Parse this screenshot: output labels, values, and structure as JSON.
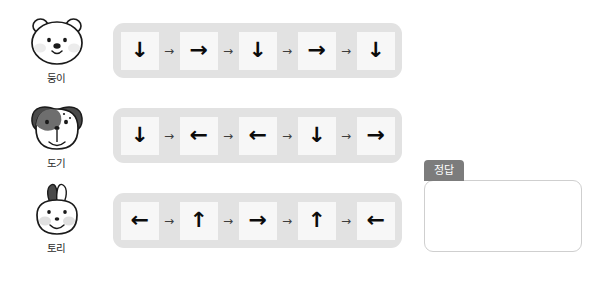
{
  "worksheet": {
    "rows": [
      {
        "character": {
          "name": "둥이",
          "species": "bear",
          "icon": "bear-face-icon"
        },
        "sequence": [
          "↓",
          "→",
          "↓",
          "→",
          "↓"
        ],
        "connectors": [
          "→",
          "→",
          "→",
          "→"
        ]
      },
      {
        "character": {
          "name": "도기",
          "species": "dog",
          "icon": "dog-face-icon"
        },
        "sequence": [
          "↓",
          "←",
          "←",
          "↓",
          "→"
        ],
        "connectors": [
          "→",
          "→",
          "→",
          "→"
        ]
      },
      {
        "character": {
          "name": "토리",
          "species": "rabbit",
          "icon": "rabbit-face-icon"
        },
        "sequence": [
          "←",
          "↑",
          "→",
          "↑",
          "←"
        ],
        "connectors": [
          "→",
          "→",
          "→",
          "→"
        ]
      }
    ]
  },
  "answer": {
    "tab_label": "정답",
    "value": ""
  },
  "colors": {
    "pill_background": "#e2e2e2",
    "cell_background": "#f7f7f7",
    "arrow": "#0b0b0b",
    "connector": "#3d3d3d",
    "tab": "#7c7c7c",
    "box_border": "#cfcfcf",
    "dark_fur": "#4a4a4a",
    "blush": "#e3e3e3"
  }
}
